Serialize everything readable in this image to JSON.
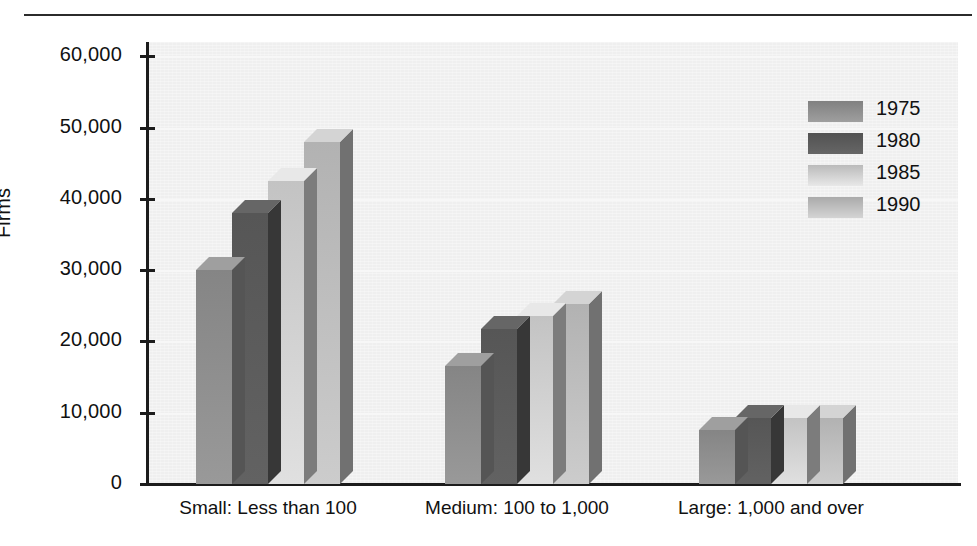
{
  "chart_data": {
    "type": "bar",
    "title": "",
    "xlabel": "",
    "ylabel": "Firms",
    "ylim": [
      0,
      62000
    ],
    "yticks": [
      0,
      10000,
      20000,
      30000,
      40000,
      50000,
      60000
    ],
    "ytick_labels": [
      "0",
      "10,000",
      "20,000",
      "30,000",
      "40,000",
      "50,000",
      "60,000"
    ],
    "grid": true,
    "legend_position": "top-right",
    "categories": [
      "Small: Less than 100",
      "Medium: 100 to 1,000",
      "Large: 1,000 and over"
    ],
    "series": [
      {
        "name": "1975",
        "color": "#8e8e8e",
        "values": [
          30000,
          16500,
          7600
        ]
      },
      {
        "name": "1980",
        "color": "#5b5b5b",
        "values": [
          38000,
          21800,
          9300
        ]
      },
      {
        "name": "1985",
        "color": "#cfcfcf",
        "values": [
          42500,
          23500,
          9300
        ]
      },
      {
        "name": "1990",
        "color": "#bdbdbd",
        "values": [
          48000,
          25300,
          9300
        ]
      }
    ]
  },
  "legend": {
    "entries": [
      {
        "label": "1975"
      },
      {
        "label": "1980"
      },
      {
        "label": "1985"
      },
      {
        "label": "1990"
      }
    ]
  },
  "axes": {
    "y_title": "Firms"
  },
  "colors": {
    "axis": "#1c1c1c",
    "panel": "#efefef",
    "rule": "#2b2b2b"
  }
}
